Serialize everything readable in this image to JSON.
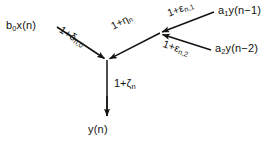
{
  "figure": {
    "type": "signal-flow-graph",
    "title": "",
    "background_color": "#ffffff",
    "line_color": "#14130f",
    "text_color": "#14130f",
    "width": 277,
    "height": 145,
    "nodes": [
      {
        "id": "sum-node",
        "name": "main-summing-node",
        "x": 107,
        "y": 60
      },
      {
        "id": "aux-node",
        "name": "feedback-summing-node",
        "x": 160,
        "y": 33
      }
    ],
    "terminals": [
      {
        "id": "input-x",
        "label": "b",
        "sub": "0",
        "rest": "x(n)",
        "x": 6,
        "y": 25
      },
      {
        "id": "fb-y1",
        "label": "a",
        "sub": "1",
        "rest": "y(n−1)",
        "x": 218,
        "y": 9
      },
      {
        "id": "fb-y2",
        "label": "a",
        "sub": "2",
        "rest": "y(n−2)",
        "x": 215,
        "y": 47
      },
      {
        "id": "output-y",
        "label": "y(n)",
        "sub": "",
        "rest": "",
        "x": 88,
        "y": 120
      }
    ],
    "branches": [
      {
        "id": "branch-input",
        "name": "input-branch",
        "from": "input-x",
        "to": "sum-node",
        "gain_pre": "1+δ",
        "gain_sub": "n,0",
        "gain_full": "1+δn,0",
        "x1": 57,
        "y1": 27,
        "x2": 107,
        "y2": 60,
        "label_x": 60,
        "label_y": 27,
        "label_rot": 33
      },
      {
        "id": "branch-eta",
        "name": "feedback-sum-branch",
        "from": "aux-node",
        "to": "sum-node",
        "gain_pre": "1+η",
        "gain_sub": "n",
        "gain_full": "1+ηn",
        "x1": 160,
        "y1": 33,
        "x2": 107,
        "y2": 60,
        "label_x": 112,
        "label_y": 22,
        "label_rot": -27
      },
      {
        "id": "branch-eps1",
        "name": "first-order-feedback-branch",
        "from": "fb-y1",
        "to": "aux-node",
        "gain_pre": "1+ε",
        "gain_sub": "n,1",
        "gain_full": "1+εn,1",
        "x1": 214,
        "y1": 12,
        "x2": 160,
        "y2": 33,
        "label_x": 168,
        "label_y": 8,
        "label_rot": -21
      },
      {
        "id": "branch-eps2",
        "name": "second-order-feedback-branch",
        "from": "fb-y2",
        "to": "aux-node",
        "gain_pre": "1+ε",
        "gain_sub": "n,2",
        "gain_full": "1+εn,2",
        "x1": 211,
        "y1": 50,
        "x2": 160,
        "y2": 33,
        "label_x": 163,
        "label_y": 40,
        "label_rot": 19
      },
      {
        "id": "branch-output",
        "name": "output-branch",
        "from": "sum-node",
        "to": "output-y",
        "gain_pre": "1+ζ",
        "gain_sub": "n",
        "gain_full": "1+ζn",
        "x1": 107,
        "y1": 60,
        "x2": 107,
        "y2": 118,
        "label_x": 114,
        "label_y": 82,
        "label_rot": 0
      }
    ]
  }
}
